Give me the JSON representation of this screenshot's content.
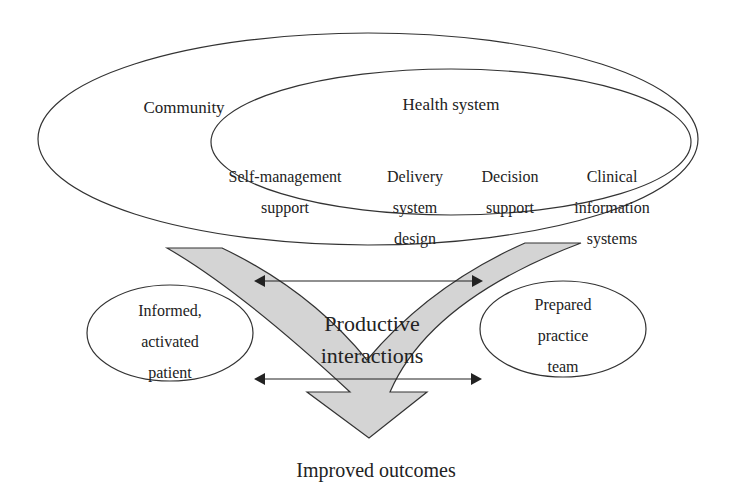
{
  "diagram": {
    "community": {
      "label": "Community"
    },
    "health_system": {
      "label": "Health system",
      "components": [
        {
          "lines": [
            "Self-management",
            "support"
          ]
        },
        {
          "lines": [
            "Delivery",
            "system",
            "design"
          ]
        },
        {
          "lines": [
            "Decision",
            "support"
          ]
        },
        {
          "lines": [
            "Clinical",
            "information",
            "systems"
          ]
        }
      ]
    },
    "patient": {
      "lines": [
        "Informed,",
        "activated",
        "patient"
      ]
    },
    "team": {
      "lines": [
        "Prepared",
        "practice",
        "team"
      ]
    },
    "interactions": {
      "lines": [
        "Productive",
        "interactions"
      ]
    },
    "outcome": {
      "label": "Improved outcomes"
    }
  },
  "colors": {
    "stroke": "#333333",
    "arrow_fill": "#d4d4d4",
    "text": "#222222"
  }
}
